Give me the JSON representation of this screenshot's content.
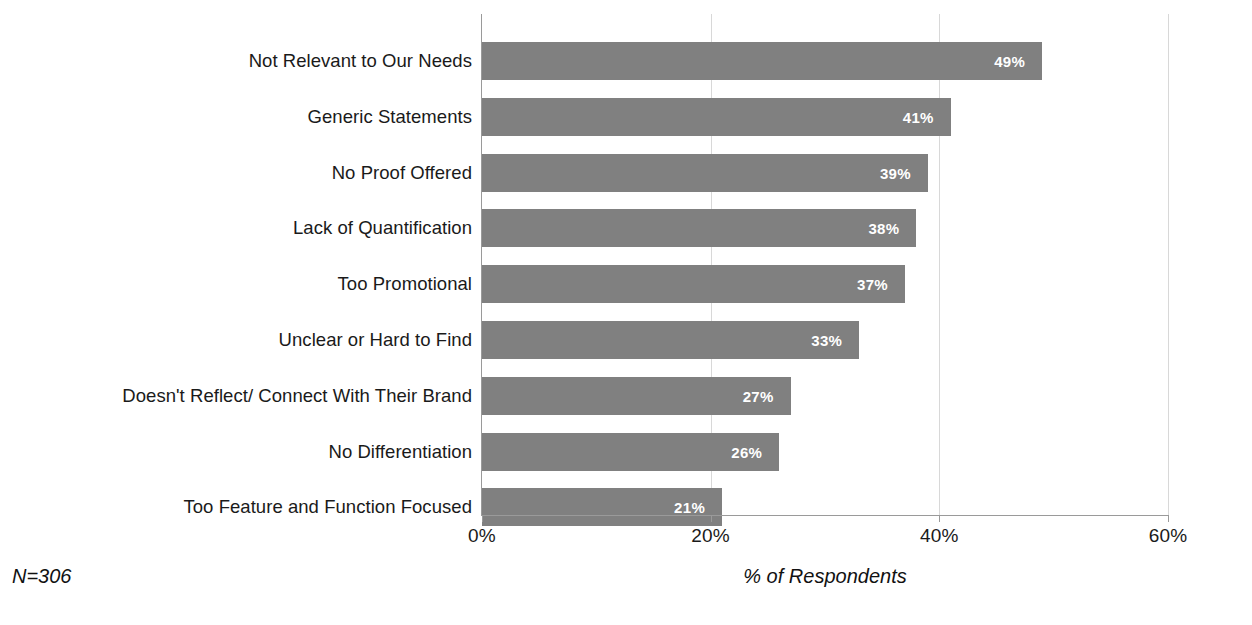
{
  "chart_data": {
    "type": "bar",
    "orientation": "horizontal",
    "title": "",
    "subtitle": "",
    "xlabel": "% of Respondents",
    "ylabel": "",
    "xlim": [
      0,
      60
    ],
    "xticks": [
      "0%",
      "20%",
      "40%",
      "60%"
    ],
    "xtick_values": [
      0,
      20,
      40,
      60
    ],
    "grid": "vertical",
    "legend": "none",
    "categories": [
      "Not Relevant to Our Needs",
      "Generic Statements",
      "No Proof Offered",
      "Lack of Quantification",
      "Too Promotional",
      "Unclear or Hard to Find",
      "Doesn't Reflect/ Connect With Their Brand",
      "No Differentiation",
      "Too Feature and Function Focused"
    ],
    "values": [
      49,
      41,
      39,
      38,
      37,
      33,
      27,
      26,
      21
    ],
    "data_labels": [
      "49%",
      "41%",
      "39%",
      "38%",
      "37%",
      "33%",
      "27%",
      "26%",
      "21%"
    ],
    "annotations": [
      "N=306"
    ],
    "bar_color": "#808080",
    "data_label_color": "#ffffff",
    "gridline_color": "#d8d8d8",
    "axis_color": "#9a9a9a"
  },
  "footer": {
    "sample_size": "N=306",
    "axis_caption": "% of Respondents"
  }
}
